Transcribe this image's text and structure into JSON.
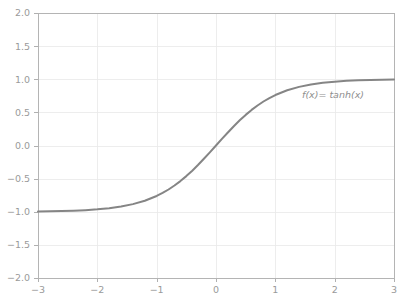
{
  "chart_data": {
    "type": "line",
    "title": "",
    "xlabel": "",
    "ylabel": "",
    "xlim": [
      -3,
      3
    ],
    "ylim": [
      -2.0,
      2.0
    ],
    "grid": true,
    "legend_position": "none",
    "annotations": [
      {
        "text": "f(x)= tanh(x)",
        "x": 1.45,
        "y": 0.72,
        "style": "italic"
      }
    ],
    "xticks": [
      -3,
      -2,
      -1,
      0,
      1,
      2,
      3
    ],
    "xticklabels": [
      "-3",
      "-2",
      "-1",
      "0",
      "1",
      "2",
      "3"
    ],
    "yticks": [
      2.0,
      1.5,
      1.0,
      0.5,
      0.0,
      -0.5,
      -1.0,
      -1.5,
      -2.0
    ],
    "yticklabels": [
      "2.0",
      "1.5",
      "1.0",
      "0.5",
      "0.0",
      "-0.5",
      "-1.0",
      "-1.5",
      "-2.0"
    ],
    "series": [
      {
        "name": "f(x)= tanh(x)",
        "color": "#858585",
        "linewidth": 2.0,
        "x": [
          -3.0,
          -2.8,
          -2.6,
          -2.4,
          -2.2,
          -2.0,
          -1.8,
          -1.6,
          -1.4,
          -1.2,
          -1.0,
          -0.9,
          -0.8,
          -0.7,
          -0.6,
          -0.5,
          -0.4,
          -0.3,
          -0.2,
          -0.1,
          0.0,
          0.1,
          0.2,
          0.3,
          0.4,
          0.5,
          0.6,
          0.7,
          0.8,
          0.9,
          1.0,
          1.2,
          1.4,
          1.6,
          1.8,
          2.0,
          2.2,
          2.4,
          2.6,
          2.8,
          3.0
        ],
        "values": [
          -0.995,
          -0.993,
          -0.989,
          -0.984,
          -0.976,
          -0.964,
          -0.947,
          -0.922,
          -0.885,
          -0.834,
          -0.762,
          -0.716,
          -0.664,
          -0.604,
          -0.537,
          -0.462,
          -0.38,
          -0.291,
          -0.197,
          -0.1,
          0.0,
          0.1,
          0.197,
          0.291,
          0.38,
          0.462,
          0.537,
          0.604,
          0.664,
          0.716,
          0.762,
          0.834,
          0.885,
          0.922,
          0.947,
          0.964,
          0.976,
          0.984,
          0.989,
          0.993,
          0.995
        ]
      }
    ]
  },
  "colors": {
    "curve": "#858585",
    "grid": "#e8e8e8",
    "axis": "#b4b4b4",
    "tick_text": "#9a9a9a",
    "annotation_text": "#8e8e8e",
    "background": "#ffffff"
  },
  "plot_geometry": {
    "left": 38,
    "right": 394,
    "top": 13,
    "bottom": 278
  }
}
